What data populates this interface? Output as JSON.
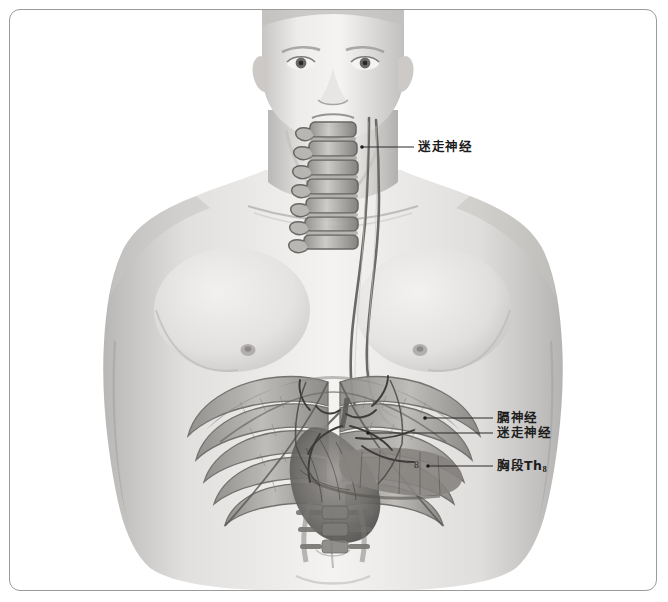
{
  "figure": {
    "type": "anatomical-illustration",
    "style": "grayscale-airbrush-medical-illustration",
    "border_color": "#9b9b9b",
    "background_color": "#ffffff",
    "ink_color": "#1d1d1d"
  },
  "labels": [
    {
      "id": "vagus-neck",
      "text": "迷走神经",
      "target": "cervical vagus nerve at neck",
      "x": 418,
      "y": 140,
      "leader": {
        "x1": 362,
        "y1": 147,
        "x2": 414,
        "y2": 147
      }
    },
    {
      "id": "phrenic",
      "text": "膈神经",
      "target": "phrenic nerve at diaphragm",
      "x": 497,
      "y": 411,
      "leader": {
        "x1": 425,
        "y1": 418,
        "x2": 493,
        "y2": 418
      }
    },
    {
      "id": "vagus-abdominal",
      "text": "迷走神经",
      "target": "abdominal vagal trunk at celiac plexus",
      "x": 497,
      "y": 426,
      "leader": {
        "x1": 368,
        "y1": 433,
        "x2": 493,
        "y2": 433
      }
    },
    {
      "id": "thoracic-th8",
      "text": "胸段Th",
      "subscript": "8",
      "target": "thoracic segment Th8",
      "x": 497,
      "y": 459,
      "leader": {
        "x1": 428,
        "y1": 466,
        "x2": 493,
        "y2": 466
      }
    }
  ],
  "marks": [
    {
      "id": "segment-number-8",
      "text": "8",
      "x": 414,
      "y": 462
    }
  ],
  "palette": {
    "skin_light": "#f2f1f0",
    "skin_mid": "#d6d4d2",
    "skin_shadow": "#a8a6a4",
    "bone": "#c9c7c4",
    "bone_shadow": "#8b8987",
    "muscle": "#9a9795",
    "organ_dark": "#4a4845",
    "nerve": "#6f6c69",
    "outline": "#2a2a2a"
  }
}
